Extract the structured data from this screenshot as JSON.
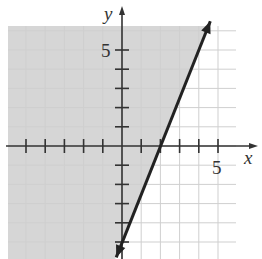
{
  "chart_data": {
    "type": "line",
    "title": "",
    "xlabel": "x",
    "ylabel": "y",
    "xlim": [
      -6,
      7
    ],
    "ylim": [
      -6,
      6
    ],
    "grid": true,
    "x_tick_labels": [
      {
        "value": 5,
        "label": "5"
      }
    ],
    "y_tick_labels": [
      {
        "value": 5,
        "label": "5"
      }
    ],
    "x_ticks": [
      -5,
      -4,
      -3,
      -2,
      -1,
      1,
      2,
      3,
      4,
      5
    ],
    "y_ticks": [
      -5,
      -4,
      -3,
      -2,
      -1,
      1,
      2,
      3,
      4,
      5
    ],
    "series": [
      {
        "name": "boundary line",
        "equation": "y = 2.5x - 5",
        "style": "solid",
        "points": [
          {
            "x": -0.3,
            "y": -5.8
          },
          {
            "x": 2,
            "y": 0
          },
          {
            "x": 4.6,
            "y": 6.5
          }
        ],
        "arrows": "both"
      }
    ],
    "shaded_region": {
      "side": "left of line",
      "inequality": "y >= 2.5x - 5",
      "color": "#d9d9d9"
    },
    "colors": {
      "line": "#222222",
      "shade": "#d6d6d6",
      "grid": "#cfcfcf",
      "axis": "#333333"
    }
  },
  "labels": {
    "x_axis": "x",
    "y_axis": "y",
    "x_five": "5",
    "y_five": "5"
  }
}
